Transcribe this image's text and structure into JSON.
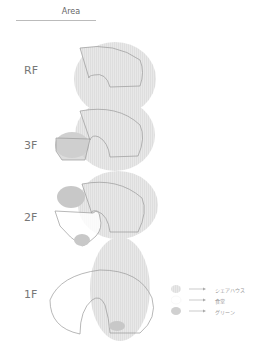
{
  "header": {
    "title": "Area"
  },
  "floors": [
    {
      "label": "RF"
    },
    {
      "label": "3F"
    },
    {
      "label": "2F"
    },
    {
      "label": "1F"
    }
  ],
  "legend": [
    {
      "label": "シェアハウス",
      "swatch": "hatched-light-grey"
    },
    {
      "label": "食堂",
      "swatch": "white"
    },
    {
      "label": "グリーン",
      "swatch": "grey"
    }
  ],
  "colors": {
    "share_house": "#e6e6e6",
    "dining": "#ffffff",
    "green": "#cfcfcf",
    "outline": "#9a9a9a",
    "text": "#777777"
  }
}
